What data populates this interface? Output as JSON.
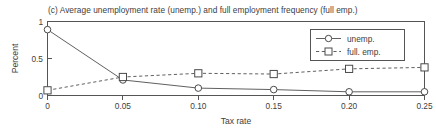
{
  "chart_data": {
    "type": "line",
    "title": "(c) Average unemployment rate (unemp.) and full employment frequency (full emp.)",
    "xlabel": "Tax rate",
    "ylabel": "Percent",
    "x": [
      0,
      0.05,
      0.1,
      0.15,
      0.2,
      0.25
    ],
    "xtick_labels": [
      "0",
      "0.05",
      "0.10",
      "0.15",
      "0.20",
      "0.25"
    ],
    "ytick_labels": [
      "0",
      "0.5",
      "1"
    ],
    "yticks": [
      0,
      0.5,
      1
    ],
    "xlim": [
      0,
      0.25
    ],
    "ylim": [
      0,
      1
    ],
    "grid": false,
    "legend_position": "upper right",
    "series": [
      {
        "name": "unemp.",
        "values": [
          0.89,
          0.21,
          0.1,
          0.08,
          0.05,
          0.05
        ],
        "linestyle": "solid",
        "marker": "circle",
        "color": "#606060"
      },
      {
        "name": "full. emp.",
        "values": [
          0.07,
          0.25,
          0.3,
          0.29,
          0.36,
          0.38
        ],
        "linestyle": "dashed",
        "marker": "square",
        "color": "#606060"
      }
    ]
  },
  "legend": {
    "entries": [
      {
        "label": "unemp."
      },
      {
        "label": "full. emp."
      }
    ]
  },
  "colors": {
    "line": "#606060",
    "axis": "#555555",
    "text": "#404040",
    "background": "#ffffff"
  }
}
